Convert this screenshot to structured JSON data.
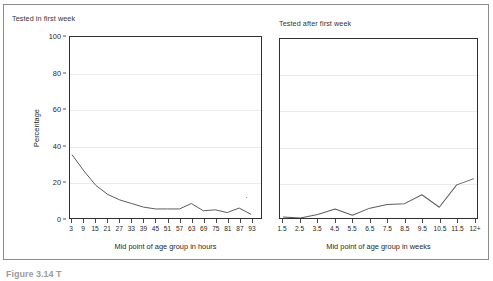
{
  "figure": {
    "caption": "Figure 3.14 T"
  },
  "axes": {
    "y_title": "Percentage",
    "y_ticks": [
      "0",
      "20",
      "40",
      "60",
      "80",
      "100"
    ]
  },
  "panels": {
    "left": {
      "title": "Tested in first week",
      "x_title": "Mid point of age group in hours"
    },
    "right": {
      "title": "Tested after first week",
      "x_title": "Mid point of age group in weeks"
    }
  },
  "chart_data": [
    {
      "type": "line",
      "title": "Tested in first week",
      "xlabel": "Mid point of age group in hours",
      "ylabel": "Percentage",
      "ylim": [
        0,
        100
      ],
      "grid": true,
      "legend": "none",
      "categories": [
        "3",
        "9",
        "15",
        "21",
        "27",
        "33",
        "39",
        "45",
        "51",
        "57",
        "63",
        "69",
        "75",
        "81",
        "87",
        "93"
      ],
      "values": [
        35,
        26,
        18,
        13,
        10,
        8,
        6,
        5,
        5,
        5,
        8,
        4,
        4.5,
        3,
        5.5,
        2
      ]
    },
    {
      "type": "line",
      "title": "Tested after first week",
      "xlabel": "Mid point of age group in weeks",
      "ylabel": "Percentage",
      "ylim": [
        0,
        100
      ],
      "grid": true,
      "legend": "none",
      "categories": [
        "1.5",
        "2.5",
        "3.5",
        "4.5",
        "5.5",
        "6.5",
        "7.5",
        "8.5",
        "9.5",
        "10.5",
        "11.5",
        "12+"
      ],
      "values": [
        0.5,
        0,
        2,
        5,
        1.5,
        5.5,
        7.5,
        8,
        13,
        6,
        18.5,
        22
      ]
    }
  ]
}
